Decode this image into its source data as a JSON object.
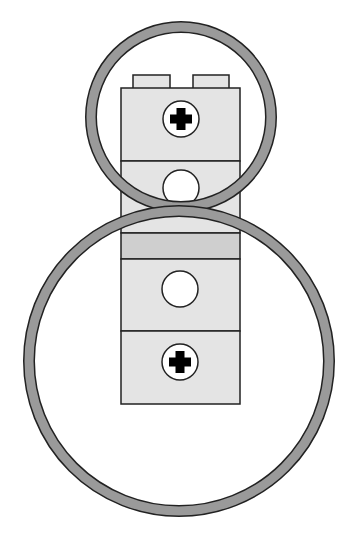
{
  "diagram": {
    "colors": {
      "background": "#ffffff",
      "brick_fill": "#e4e4e4",
      "band_fill": "#cfcfcf",
      "ring_fill": "#9a9a9a",
      "outline": "#222222",
      "hole_fill": "#ffffff",
      "axle_fill": "#000000"
    },
    "components": [
      {
        "id": "small-ring",
        "shape": "ring",
        "cx": 181,
        "cy": 117,
        "r": 90,
        "stroke": 11
      },
      {
        "id": "large-ring",
        "shape": "ring",
        "cx": 179,
        "cy": 361,
        "r": 150,
        "stroke": 11
      },
      {
        "id": "brick-top",
        "shape": "brick",
        "studs": 2,
        "hole": "axle"
      },
      {
        "id": "brick-pin",
        "shape": "brick",
        "hole": "round"
      },
      {
        "id": "plate-band",
        "shape": "plate"
      },
      {
        "id": "brick-mid",
        "shape": "brick",
        "hole": "round"
      },
      {
        "id": "brick-bottom",
        "shape": "brick",
        "hole": "axle"
      }
    ]
  }
}
